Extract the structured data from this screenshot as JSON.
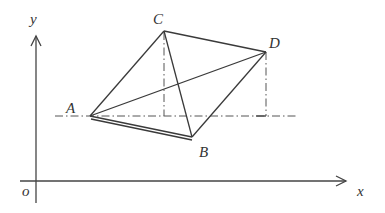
{
  "diagram": {
    "type": "coordinate-geometry-figure",
    "axes": {
      "x_label": "x",
      "y_label": "y",
      "origin_label": "o"
    },
    "points": [
      {
        "name": "A",
        "label": "A"
      },
      {
        "name": "B",
        "label": "B"
      },
      {
        "name": "C",
        "label": "C"
      },
      {
        "name": "D",
        "label": "D"
      }
    ],
    "segments": [
      {
        "from": "A",
        "to": "C",
        "style": "solid"
      },
      {
        "from": "C",
        "to": "D",
        "style": "solid"
      },
      {
        "from": "D",
        "to": "B",
        "style": "solid"
      },
      {
        "from": "A",
        "to": "B",
        "style": "double"
      },
      {
        "from": "A",
        "to": "D",
        "style": "solid"
      },
      {
        "from": "C",
        "to": "B",
        "style": "solid"
      }
    ],
    "auxiliary_lines": [
      {
        "description": "horizontal dash-dot line through A",
        "style": "dash-dot"
      },
      {
        "description": "vertical dash-dot drop from C",
        "style": "dash-dot"
      },
      {
        "description": "vertical dash-dot drop from D",
        "style": "dash-dot"
      }
    ]
  }
}
